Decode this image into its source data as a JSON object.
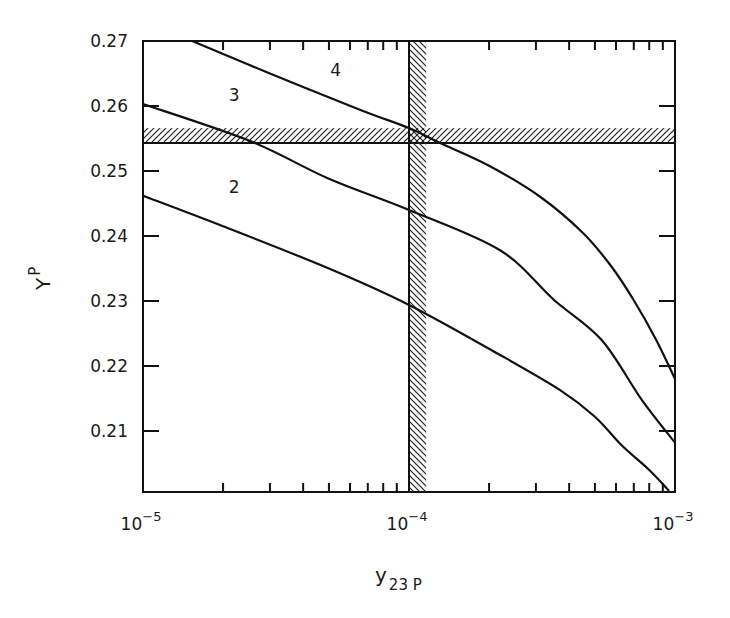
{
  "chart_data": {
    "type": "line",
    "title": "",
    "xlabel": "y",
    "xlabel_subscript": "23 P",
    "ylabel": "Y",
    "ylabel_subscript": "P",
    "xscale": "log",
    "xlim": [
      1e-05,
      0.001
    ],
    "ylim": [
      0.201,
      0.27
    ],
    "grid": false,
    "legend": "none (curves labeled inline)",
    "x_ticks": [
      {
        "value": 1e-05,
        "base": "10",
        "exp": "−5"
      },
      {
        "value": 0.0001,
        "base": "10",
        "exp": "−4"
      },
      {
        "value": 0.001,
        "base": "10",
        "exp": "−3"
      }
    ],
    "y_ticks": [
      "0.27",
      "0.26",
      "0.25",
      "0.24",
      "0.23",
      "0.22",
      "0.21"
    ],
    "y_tick_values": [
      0.27,
      0.26,
      0.25,
      0.24,
      0.23,
      0.22,
      0.21
    ],
    "series": [
      {
        "name": "2",
        "label_pos": [
          2.2e-05,
          0.2475
        ],
        "points": [
          [
            1e-05,
            0.2462
          ],
          [
            2e-05,
            0.2415
          ],
          [
            5e-05,
            0.235
          ],
          [
            0.0001,
            0.2294
          ],
          [
            0.00022,
            0.2217
          ],
          [
            0.00037,
            0.2163
          ],
          [
            0.0005,
            0.2122
          ],
          [
            0.00063,
            0.2078
          ],
          [
            0.0008,
            0.204
          ],
          [
            0.00095,
            0.2008
          ]
        ]
      },
      {
        "name": "3",
        "label_pos": [
          2.2e-05,
          0.2617
        ],
        "points": [
          [
            1e-05,
            0.2603
          ],
          [
            2.53e-05,
            0.2546
          ],
          [
            5e-05,
            0.2488
          ],
          [
            0.0001,
            0.244
          ],
          [
            0.00022,
            0.2378
          ],
          [
            0.00035,
            0.2302
          ],
          [
            0.00053,
            0.224
          ],
          [
            0.00075,
            0.2148
          ],
          [
            0.001,
            0.2082
          ]
        ]
      },
      {
        "name": "4",
        "label_pos": [
          5.3e-05,
          0.2655
        ],
        "points": [
          [
            1.53e-05,
            0.27
          ],
          [
            3e-05,
            0.265
          ],
          [
            6.57e-05,
            0.2594
          ],
          [
            0.0001,
            0.2566
          ],
          [
            0.000131,
            0.2543
          ],
          [
            0.0002,
            0.2508
          ],
          [
            0.000312,
            0.246
          ],
          [
            0.00045,
            0.2405
          ],
          [
            0.000572,
            0.2355
          ],
          [
            0.000698,
            0.2302
          ],
          [
            0.00085,
            0.224
          ],
          [
            0.001,
            0.218
          ]
        ]
      }
    ],
    "bands": [
      {
        "orientation": "horizontal",
        "hatch": "forward",
        "from": 0.2543,
        "to": 0.2566,
        "solid_edge": "bottom"
      },
      {
        "orientation": "vertical",
        "hatch": "backward",
        "from": 0.0001,
        "to": 0.000116,
        "solid_edge": "left"
      }
    ]
  }
}
